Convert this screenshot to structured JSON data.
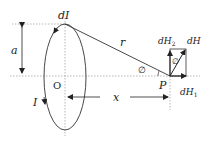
{
  "diagram": {
    "labels": {
      "current_element": "dI",
      "radius": "a",
      "distance_r": "r",
      "angle_at_P": "∅",
      "angle_in_box": "∅",
      "center": "O",
      "current": "I",
      "axial_distance": "x",
      "point": "P",
      "dH2_main": "dH",
      "dH2_sub": "2",
      "dH_main": "dH",
      "dH1_main": "dH",
      "dH1_sub": "1"
    },
    "colors": {
      "line": "#333333",
      "dotted": "#888888",
      "text": "#222222"
    }
  }
}
